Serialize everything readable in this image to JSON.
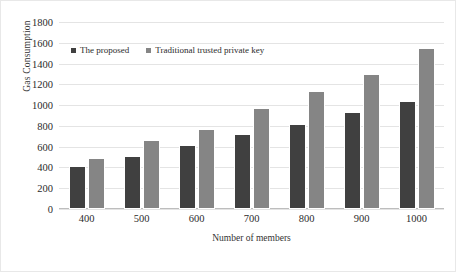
{
  "chart_data": {
    "type": "bar",
    "title": "",
    "xlabel": "Number of members",
    "ylabel": "Gas Consumption",
    "categories": [
      "400",
      "500",
      "600",
      "700",
      "800",
      "900",
      "1000"
    ],
    "series": [
      {
        "name": "The proposed",
        "color": "#404040",
        "values": [
          410,
          515,
          620,
          720,
          820,
          930,
          1040
        ]
      },
      {
        "name": "Traditional trusted private key",
        "color": "#858585",
        "values": [
          495,
          665,
          770,
          975,
          1135,
          1300,
          1550
        ]
      }
    ],
    "ylim": [
      0,
      1800
    ],
    "ytick_labels": [
      "1800",
      "1600",
      "1400",
      "1200",
      "1000",
      "800",
      "600",
      "400",
      "200",
      "0"
    ],
    "ytick_values": [
      1800,
      1600,
      1400,
      1200,
      1000,
      800,
      600,
      400,
      200,
      0
    ],
    "grid": true,
    "grid_axis": "y",
    "legend_position": "top-left-inside"
  }
}
